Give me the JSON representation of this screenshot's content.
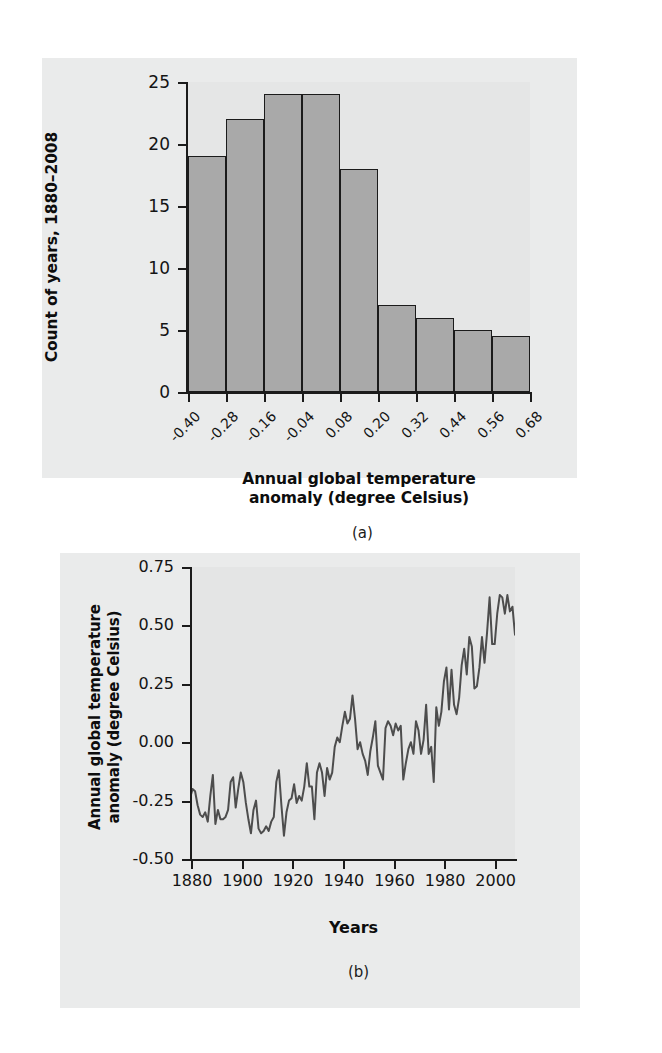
{
  "figure_a": {
    "caption": "(a)",
    "ylabel": "Count of years, 1880–2008",
    "xlabel_line1": "Annual global temperature",
    "xlabel_line2": "anomaly (degree Celsius)"
  },
  "figure_b": {
    "caption": "(b)",
    "ylabel_line1": "Annual global temperature",
    "ylabel_line2": "anomaly (degree Celsius)",
    "xlabel": "Years"
  },
  "colors": {
    "bar_fill": "#a9a9a9",
    "bar_stroke": "#1b1b1b",
    "panel_bg": "#eaebeb",
    "plot_bg": "#e5e6e6",
    "line_stroke": "#4d4d4d",
    "text": "#0d0d0d"
  },
  "chart_data": [
    {
      "type": "bar",
      "id": "histogram",
      "title": "",
      "xlabel": "Annual global temperature anomaly (degree Celsius)",
      "ylabel": "Count of years, 1880–2008",
      "categories": [
        "-0.40",
        "-0.28",
        "-0.16",
        "-0.04",
        "0.08",
        "0.20",
        "0.32",
        "0.44",
        "0.56",
        "0.68"
      ],
      "bin_edges": [
        -0.4,
        -0.28,
        -0.16,
        -0.04,
        0.08,
        0.2,
        0.32,
        0.44,
        0.56,
        0.68
      ],
      "values": [
        19,
        22,
        24,
        24,
        18,
        7,
        6,
        5,
        4.5
      ],
      "ytick_labels": [
        "0",
        "5",
        "10",
        "15",
        "20",
        "25"
      ],
      "yticks": [
        0,
        5,
        10,
        15,
        20,
        25
      ],
      "ylim": [
        0,
        25
      ],
      "grid": false,
      "legend": "none"
    },
    {
      "type": "line",
      "id": "timeseries",
      "title": "",
      "xlabel": "Years",
      "ylabel": "Annual global temperature anomaly (degree Celsius)",
      "xtick_labels": [
        "1880",
        "1900",
        "1920",
        "1940",
        "1960",
        "1980",
        "2000"
      ],
      "xticks": [
        1880,
        1900,
        1920,
        1940,
        1960,
        1980,
        2000
      ],
      "ytick_labels": [
        "-0.50",
        "-0.25",
        "0.00",
        "0.25",
        "0.50",
        "0.75"
      ],
      "yticks": [
        -0.5,
        -0.25,
        0.0,
        0.25,
        0.5,
        0.75
      ],
      "xlim": [
        1880,
        2008
      ],
      "ylim": [
        -0.5,
        0.75
      ],
      "grid": false,
      "legend": "none",
      "series": [
        {
          "name": "Annual global temperature anomaly",
          "x": [
            1880,
            1881,
            1882,
            1883,
            1884,
            1885,
            1886,
            1887,
            1888,
            1889,
            1890,
            1891,
            1892,
            1893,
            1894,
            1895,
            1896,
            1897,
            1898,
            1899,
            1900,
            1901,
            1902,
            1903,
            1904,
            1905,
            1906,
            1907,
            1908,
            1909,
            1910,
            1911,
            1912,
            1913,
            1914,
            1915,
            1916,
            1917,
            1918,
            1919,
            1920,
            1921,
            1922,
            1923,
            1924,
            1925,
            1926,
            1927,
            1928,
            1929,
            1930,
            1931,
            1932,
            1933,
            1934,
            1935,
            1936,
            1937,
            1938,
            1939,
            1940,
            1941,
            1942,
            1943,
            1944,
            1945,
            1946,
            1947,
            1948,
            1949,
            1950,
            1951,
            1952,
            1953,
            1954,
            1955,
            1956,
            1957,
            1958,
            1959,
            1960,
            1961,
            1962,
            1963,
            1964,
            1965,
            1966,
            1967,
            1968,
            1969,
            1970,
            1971,
            1972,
            1973,
            1974,
            1975,
            1976,
            1977,
            1978,
            1979,
            1980,
            1981,
            1982,
            1983,
            1984,
            1985,
            1986,
            1987,
            1988,
            1989,
            1990,
            1991,
            1992,
            1993,
            1994,
            1995,
            1996,
            1997,
            1998,
            1999,
            2000,
            2001,
            2002,
            2003,
            2004,
            2005,
            2006,
            2007,
            2008
          ],
          "values": [
            -0.24,
            -0.2,
            -0.21,
            -0.27,
            -0.31,
            -0.32,
            -0.3,
            -0.34,
            -0.23,
            -0.14,
            -0.35,
            -0.29,
            -0.33,
            -0.33,
            -0.32,
            -0.29,
            -0.17,
            -0.15,
            -0.28,
            -0.2,
            -0.13,
            -0.17,
            -0.26,
            -0.33,
            -0.39,
            -0.29,
            -0.25,
            -0.37,
            -0.39,
            -0.38,
            -0.36,
            -0.38,
            -0.34,
            -0.32,
            -0.17,
            -0.12,
            -0.27,
            -0.4,
            -0.3,
            -0.25,
            -0.24,
            -0.18,
            -0.26,
            -0.23,
            -0.25,
            -0.19,
            -0.09,
            -0.19,
            -0.19,
            -0.33,
            -0.13,
            -0.09,
            -0.13,
            -0.23,
            -0.11,
            -0.16,
            -0.13,
            -0.02,
            0.02,
            0.0,
            0.07,
            0.13,
            0.08,
            0.1,
            0.2,
            0.1,
            -0.03,
            0.0,
            -0.05,
            -0.08,
            -0.14,
            -0.04,
            0.02,
            0.09,
            -0.1,
            -0.13,
            -0.16,
            0.06,
            0.09,
            0.07,
            0.03,
            0.08,
            0.05,
            0.07,
            -0.16,
            -0.09,
            -0.03,
            0.0,
            -0.05,
            0.09,
            0.05,
            -0.05,
            0.01,
            0.16,
            -0.05,
            -0.02,
            -0.17,
            0.15,
            0.07,
            0.13,
            0.26,
            0.32,
            0.14,
            0.31,
            0.16,
            0.12,
            0.19,
            0.33,
            0.4,
            0.29,
            0.45,
            0.41,
            0.23,
            0.24,
            0.32,
            0.45,
            0.34,
            0.47,
            0.62,
            0.42,
            0.42,
            0.55,
            0.63,
            0.62,
            0.55,
            0.63,
            0.56,
            0.58,
            0.46
          ]
        }
      ]
    }
  ]
}
